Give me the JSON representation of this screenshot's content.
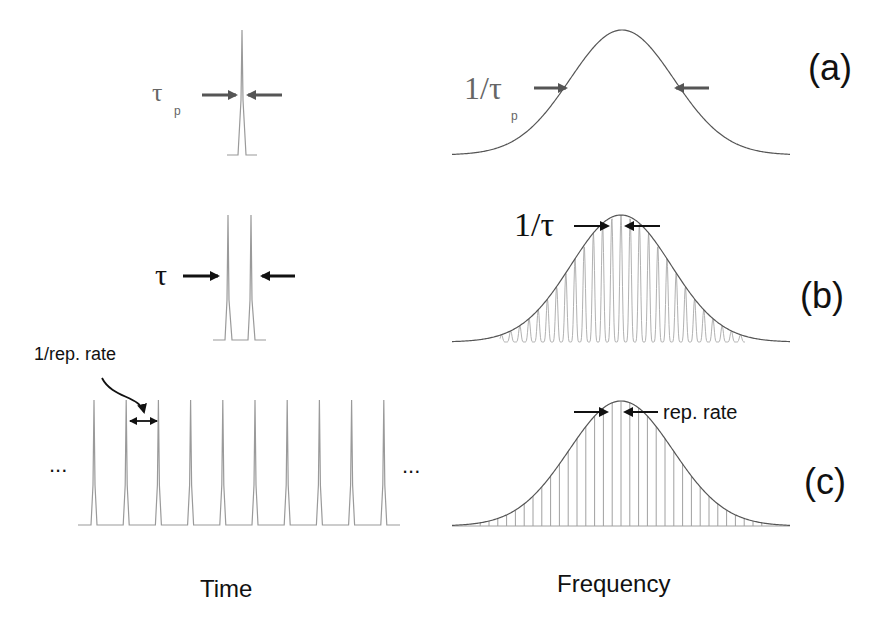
{
  "panels": {
    "a": {
      "label": "(a)",
      "time_label_main": "τ",
      "time_label_sub": "p",
      "freq_label_main": "1/τ",
      "freq_label_sub": "p",
      "time_description": "single short pulse of duration tau_p",
      "freq_description": "broad Gaussian spectrum of width 1/tau_p"
    },
    "b": {
      "label": "(b)",
      "time_label": "τ",
      "freq_label": "1/τ",
      "time_description": "pulse pair separated by tau",
      "freq_description": "spectral fringes spaced 1/tau under Gaussian envelope"
    },
    "c": {
      "label": "(c)",
      "time_label": "1/rep. rate",
      "freq_label": "rep. rate",
      "ellipsis_left": "...",
      "ellipsis_right": "...",
      "pulse_count": 10,
      "time_description": "periodic pulse train with period 1/rep. rate",
      "freq_description": "frequency comb with line spacing rep. rate under Gaussian envelope"
    }
  },
  "axes": {
    "time": "Time",
    "frequency": "Frequency"
  },
  "colors": {
    "pulse": "#9a9a9a",
    "envelope": "#555555",
    "comb": "#a0a0a0",
    "arrow_gray": "#555555",
    "arrow_black": "#111111",
    "text_gray": "#666666",
    "text_black": "#111111"
  }
}
